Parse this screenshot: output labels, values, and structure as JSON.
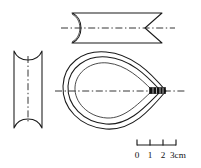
{
  "figure": {
    "background_color": "#ffffff",
    "ink_color": "#1a1a1a",
    "joint_color": "#111111",
    "views": [
      {
        "id": "top-view",
        "name": "top-view-band",
        "label": "",
        "shape": "elongated band, concave rounded left end, V-notched right end",
        "bounds": {
          "x": 70,
          "y": 13,
          "width": 92,
          "height": 30
        },
        "centerline_y": 28
      },
      {
        "id": "end-view",
        "name": "end-view-band",
        "label": "",
        "shape": "rectangle with concave arcs at top and bottom",
        "bounds": {
          "x": 13,
          "y": 51,
          "width": 30,
          "height": 77
        },
        "centerline_x": 28
      },
      {
        "id": "side-view",
        "name": "side-view-loop",
        "label": "",
        "shape": "teardrop loop formed by bent band meeting at a point on the right",
        "bounds": {
          "x": 63,
          "y": 52,
          "width": 104,
          "height": 78
        },
        "centerline_y": 91
      }
    ]
  },
  "scale_bar": {
    "name": "scale-bar",
    "unit": "cm",
    "unit_label": "3cm",
    "ticks": [
      {
        "value": "0",
        "x": 137
      },
      {
        "value": "1",
        "x": 150
      },
      {
        "value": "2",
        "x": 163
      },
      {
        "value": "3",
        "x": 176
      }
    ],
    "tick_labels": [
      "0",
      "1",
      "2",
      "3cm"
    ],
    "bar_y": 145,
    "tick_height": 6,
    "total_length_cm": 3
  }
}
